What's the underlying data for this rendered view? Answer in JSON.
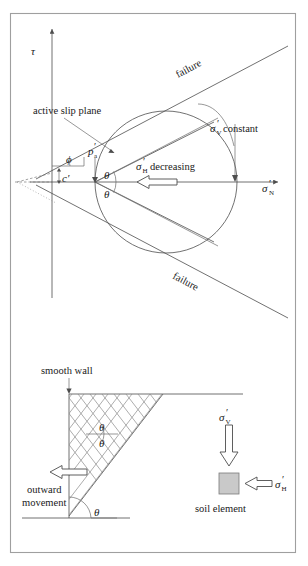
{
  "figure": {
    "border_color": "#9f9f9f",
    "line_color": "#4d4d4d",
    "hatch_color": "#8a8a8a",
    "element_fill": "#c9c9c9"
  },
  "top_diagram": {
    "name": "mohr-circle-diagram",
    "y_axis_label": "τ",
    "x_axis_label": {
      "symbol": "σ",
      "subscript": "N",
      "prime": "′"
    },
    "failure_label_upper": "failure",
    "failure_label_lower": "failure",
    "friction_angle_label": "ϕ",
    "cohesion_label": "c′",
    "active_slip_plane_label": "active slip plane",
    "pa_label": {
      "symbol": "p",
      "subscript": "a",
      "prime": "′"
    },
    "theta_upper": "θ",
    "theta_lower": "θ",
    "sigma_v_constant": {
      "symbol": "σ",
      "subscript": "V",
      "prime": "′",
      "text": "constant"
    },
    "sigma_h_decreasing": {
      "symbol": "σ",
      "subscript": "H",
      "prime": "′",
      "text": "decreasing"
    }
  },
  "bottom_diagram": {
    "name": "retaining-wall-diagram",
    "smooth_wall_label": "smooth wall",
    "outward_movement_line1": "outward",
    "outward_movement_line2": "movement",
    "theta_wedge_upper": "θ",
    "theta_wedge_lower": "θ",
    "theta_base": "θ",
    "soil_element_label": "soil element",
    "sigma_v": {
      "symbol": "σ",
      "subscript": "V",
      "prime": "′"
    },
    "sigma_h": {
      "symbol": "σ",
      "subscript": "H",
      "prime": "′"
    }
  }
}
